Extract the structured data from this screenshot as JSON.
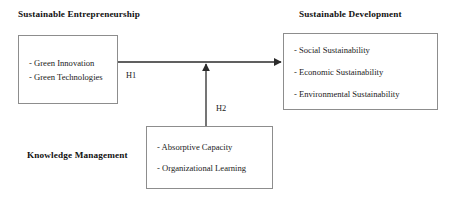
{
  "diagram": {
    "title_left": "Sustainable Entrepreneurship",
    "title_right": "Sustainable Development",
    "title_bottom": "Knowledge Management",
    "boxes": {
      "sustainable_entrepreneurship": {
        "heading": "Sustainable Entrepreneurship",
        "items": [
          "- Green Innovation",
          "- Green Technologies"
        ]
      },
      "sustainable_development": {
        "heading": "Sustainable Development",
        "items": [
          "- Social Sustainability",
          "- Economic Sustainability",
          "- Environmental Sustainability"
        ]
      },
      "knowledge_management": {
        "heading": "Knowledge Management",
        "items": [
          "- Absorptive Capacity",
          "- Organizational Learning"
        ]
      }
    },
    "edges": [
      {
        "label": "H1",
        "from": "sustainable_entrepreneurship",
        "to": "sustainable_development",
        "direction": "right"
      },
      {
        "label": "H2",
        "from": "knowledge_management",
        "to": "h1-path",
        "direction": "up"
      }
    ],
    "colors": {
      "box_border": "#8d8d8d",
      "connector": "#2b2b2b",
      "text": "#1b1b1b",
      "background": "#ffffff"
    }
  }
}
